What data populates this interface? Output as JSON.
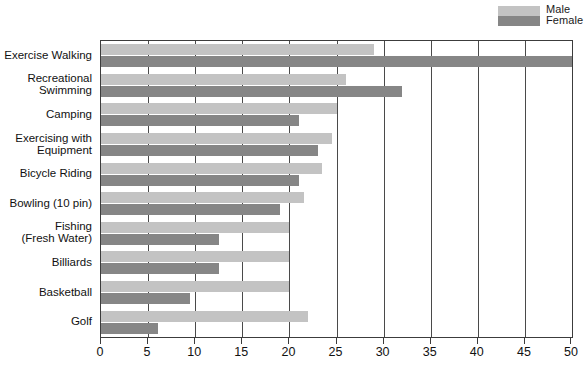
{
  "legend": {
    "position": "top-right",
    "entries": [
      {
        "label": "Male",
        "color": "#c3c3c3"
      },
      {
        "label": "Female",
        "color": "#868686"
      }
    ]
  },
  "axis": {
    "ticks": [
      0,
      5,
      10,
      15,
      20,
      25,
      30,
      35,
      40,
      45,
      50
    ],
    "tick_labels": [
      "0",
      "5",
      "10",
      "15",
      "20",
      "25",
      "30",
      "35",
      "40",
      "45",
      "50"
    ],
    "min": 0,
    "max": 50
  },
  "chart_data": {
    "type": "bar",
    "orientation": "horizontal",
    "title": "",
    "subtitle": "",
    "xlabel": "",
    "ylabel": "",
    "xlim": [
      0,
      50
    ],
    "grid": true,
    "legend_position": "top-right",
    "categories": [
      "Exercise Walking",
      "Recreational\nSwimming",
      "Camping",
      "Exercising with\nEquipment",
      "Bicycle Riding",
      "Bowling (10 pin)",
      "Fishing\n(Fresh Water)",
      "Billiards",
      "Basketball",
      "Golf"
    ],
    "series": [
      {
        "name": "Male",
        "color": "#c3c3c3",
        "values": [
          29,
          26,
          25,
          24.5,
          23.5,
          21.5,
          20,
          20,
          20,
          22
        ]
      },
      {
        "name": "Female",
        "color": "#868686",
        "values": [
          50,
          32,
          21,
          23,
          21,
          19,
          12.5,
          12.5,
          9.5,
          6
        ]
      }
    ]
  }
}
